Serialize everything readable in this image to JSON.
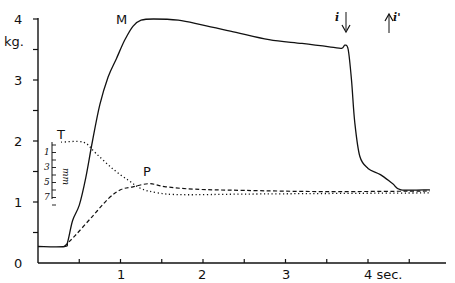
{
  "chart_data": {
    "type": "line",
    "title": "",
    "xlabel": "sec.",
    "ylabel": "kg.",
    "xlim": [
      0,
      4.9
    ],
    "ylim": [
      0,
      4
    ],
    "grid": false,
    "legend": "inline curve labels",
    "x_ticks": [
      {
        "value": 0.5,
        "label": ""
      },
      {
        "value": 1,
        "label": "1"
      },
      {
        "value": 1.5,
        "label": ""
      },
      {
        "value": 2,
        "label": "2"
      },
      {
        "value": 2.5,
        "label": ""
      },
      {
        "value": 3,
        "label": "3"
      },
      {
        "value": 3.5,
        "label": ""
      },
      {
        "value": 4,
        "label": "4 sec."
      },
      {
        "value": 4.5,
        "label": ""
      }
    ],
    "y_ticks": [
      {
        "value": 0,
        "label": "0"
      },
      {
        "value": 0.5,
        "label": ""
      },
      {
        "value": 1,
        "label": "1"
      },
      {
        "value": 1.5,
        "label": ""
      },
      {
        "value": 2,
        "label": "2"
      },
      {
        "value": 2.5,
        "label": ""
      },
      {
        "value": 3,
        "label": "3"
      },
      {
        "value": 3.5,
        "label": ""
      },
      {
        "value": 4,
        "label": "4"
      }
    ],
    "series": [
      {
        "name": "M",
        "style": "solid",
        "points": [
          [
            0,
            0.27
          ],
          [
            0.32,
            0.27
          ],
          [
            0.36,
            0.35
          ],
          [
            0.42,
            0.7
          ],
          [
            0.5,
            0.95
          ],
          [
            0.58,
            1.4
          ],
          [
            0.66,
            2.0
          ],
          [
            0.75,
            2.6
          ],
          [
            0.85,
            3.05
          ],
          [
            0.95,
            3.35
          ],
          [
            1.05,
            3.65
          ],
          [
            1.15,
            3.88
          ],
          [
            1.25,
            3.98
          ],
          [
            1.4,
            4.0
          ],
          [
            1.7,
            3.98
          ],
          [
            2.0,
            3.9
          ],
          [
            2.4,
            3.78
          ],
          [
            2.8,
            3.66
          ],
          [
            3.2,
            3.6
          ],
          [
            3.55,
            3.54
          ],
          [
            3.68,
            3.52
          ],
          [
            3.72,
            3.57
          ],
          [
            3.76,
            3.5
          ],
          [
            3.8,
            3.0
          ],
          [
            3.84,
            2.3
          ],
          [
            3.9,
            1.75
          ],
          [
            4.0,
            1.55
          ],
          [
            4.15,
            1.45
          ],
          [
            4.3,
            1.3
          ],
          [
            4.4,
            1.2
          ],
          [
            4.75,
            1.2
          ]
        ]
      },
      {
        "name": "T",
        "style": "dotted",
        "points": [
          [
            0.28,
            1.98
          ],
          [
            0.55,
            1.98
          ],
          [
            0.7,
            1.8
          ],
          [
            0.9,
            1.55
          ],
          [
            1.1,
            1.35
          ],
          [
            1.25,
            1.22
          ],
          [
            1.45,
            1.15
          ],
          [
            1.75,
            1.12
          ],
          [
            2.5,
            1.13
          ],
          [
            3.5,
            1.14
          ],
          [
            4.75,
            1.15
          ]
        ]
      },
      {
        "name": "P",
        "style": "dashed",
        "points": [
          [
            0.32,
            0.27
          ],
          [
            0.45,
            0.45
          ],
          [
            0.65,
            0.75
          ],
          [
            0.85,
            1.05
          ],
          [
            1.0,
            1.2
          ],
          [
            1.15,
            1.25
          ],
          [
            1.35,
            1.3
          ],
          [
            1.55,
            1.25
          ],
          [
            1.9,
            1.21
          ],
          [
            2.5,
            1.19
          ],
          [
            3.5,
            1.17
          ],
          [
            4.75,
            1.18
          ]
        ]
      }
    ],
    "annotations": [
      {
        "text": "M",
        "x": 1.05,
        "y": 3.95
      },
      {
        "text": "T",
        "x": 0.28,
        "y": 2.02
      },
      {
        "text": "P",
        "x": 1.32,
        "y": 1.42
      },
      {
        "text": "i",
        "marker": "down-arrow",
        "x": 3.76
      },
      {
        "text": "i'",
        "marker": "up-arrow",
        "x": 4.3
      }
    ],
    "inset_scale": {
      "unit": "mm",
      "labels": [
        "1",
        "3",
        "5",
        "7"
      ]
    }
  },
  "axes": {
    "y_unit": "kg.",
    "y_labels": [
      "0",
      "1",
      "2",
      "3",
      "4"
    ],
    "x_labels": [
      "1",
      "2",
      "3",
      "4 sec."
    ]
  },
  "curves": {
    "m_label": "M",
    "t_label": "T",
    "p_label": "P"
  },
  "markers": {
    "i_label": "i",
    "i_prime_label": "i'"
  },
  "inset": {
    "labels": [
      "1",
      "3",
      "5",
      "7"
    ],
    "unit": "mm"
  }
}
